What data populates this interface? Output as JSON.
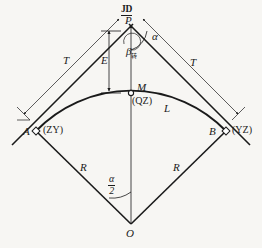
{
  "figure": {
    "background_color": "#f7f6f3",
    "line_color": "#1a1a1a"
  },
  "labels": {
    "jd": "JD",
    "p": "P",
    "alpha": "α",
    "beta": "β",
    "beta_subscript": "转",
    "e": "E",
    "m": "M",
    "qz": "(QZ)",
    "l": "L",
    "t_left": "T",
    "t_right": "T",
    "a": "A",
    "zy": "(ZY)",
    "b": "B",
    "yz": "(YZ)",
    "r_left": "R",
    "r_right": "R",
    "alpha_half_num": "α",
    "alpha_half_den": "2",
    "o": "O"
  },
  "geometry": {
    "point_p": {
      "x": 131,
      "y": 27
    },
    "point_m": {
      "x": 131,
      "y": 93
    },
    "point_a": {
      "x": 36,
      "y": 131
    },
    "point_b": {
      "x": 226,
      "y": 131
    },
    "point_o": {
      "x": 131,
      "y": 224
    },
    "radius_label_value": "R",
    "tangent_label_value": "T",
    "curve_label_value": "L",
    "external_label_value": "E"
  }
}
